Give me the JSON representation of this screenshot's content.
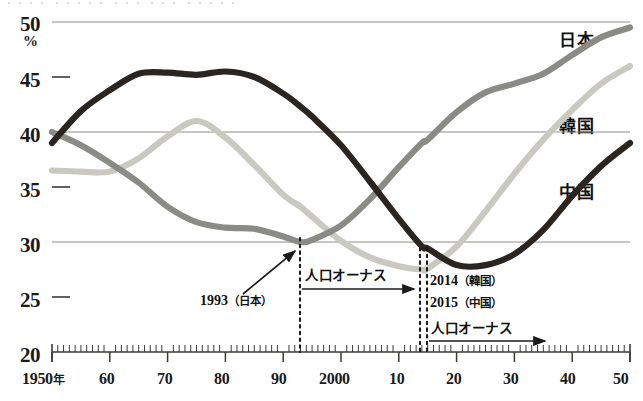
{
  "top_clipped_caption": "・・・・ ・・・・・ ・・・ ・・・ ・・・・・",
  "axes": {
    "y_unit": "%",
    "y_ticks": [
      "20",
      "25",
      "30",
      "35",
      "40",
      "45",
      "50"
    ],
    "x_ticks": [
      "1950年",
      "60",
      "70",
      "80",
      "90",
      "2000",
      "10",
      "20",
      "30",
      "40",
      "50"
    ],
    "x_first_label_main": "1950",
    "x_first_label_suffix": "年"
  },
  "series_labels": {
    "japan": "日本",
    "korea": "韓国",
    "china": "中国"
  },
  "annotations": {
    "japan_turning_point": "1993",
    "japan_turning_point_paren": "（日本）",
    "onus_left": "人口オーナス",
    "korea_turning_point": "2014",
    "korea_turning_point_paren": "（韓国）",
    "china_turning_point": "2015",
    "china_turning_point_paren": "（中国）",
    "onus_right": "人口オーナス"
  },
  "colors": {
    "japan": "#8a8a86",
    "korea": "#c9c9c2",
    "china": "#2b2521",
    "gridline": "#8d8d86",
    "axis": "#3a3a36",
    "text": "#111111"
  },
  "chart_data": {
    "type": "line",
    "title": "",
    "xlabel": "",
    "ylabel": "%",
    "xlim": [
      1950,
      2050
    ],
    "ylim": [
      20,
      50
    ],
    "grid": "horizontal gridlines at 30, 40, 50; tick marks at 25, 35, 45",
    "legend_position": "right, inline at line ends",
    "x": [
      1950,
      1955,
      1960,
      1965,
      1970,
      1975,
      1980,
      1985,
      1990,
      1993,
      1995,
      2000,
      2005,
      2010,
      2014,
      2015,
      2020,
      2025,
      2030,
      2035,
      2040,
      2045,
      2050
    ],
    "series": [
      {
        "name": "日本",
        "color": "#8a8a86",
        "values": [
          40.0,
          38.8,
          37.2,
          35.4,
          33.2,
          31.8,
          31.3,
          31.2,
          30.5,
          30.0,
          30.2,
          31.5,
          33.9,
          36.8,
          39.0,
          39.3,
          41.8,
          43.6,
          44.4,
          45.3,
          47.0,
          48.6,
          49.5
        ]
      },
      {
        "name": "韓国",
        "color": "#c9c9c2",
        "values": [
          36.5,
          36.4,
          36.4,
          37.6,
          39.6,
          41.0,
          39.5,
          37.0,
          34.3,
          33.2,
          32.3,
          30.1,
          28.6,
          27.8,
          27.5,
          27.6,
          29.6,
          32.8,
          36.2,
          39.3,
          42.0,
          44.4,
          46.0
        ]
      },
      {
        "name": "中国",
        "color": "#2b2521",
        "values": [
          39.0,
          41.9,
          43.8,
          45.3,
          45.4,
          45.2,
          45.5,
          45.0,
          43.5,
          42.3,
          41.4,
          38.8,
          35.5,
          32.1,
          29.6,
          29.4,
          27.9,
          27.9,
          28.9,
          31.1,
          34.2,
          36.9,
          39.0
        ]
      }
    ],
    "markers": [
      {
        "label": "1993（日本）",
        "x": 1993,
        "note": "Japan trough / start of population onus"
      },
      {
        "label": "2014（韓国）",
        "x": 2014,
        "note": "Korea start of population onus"
      },
      {
        "label": "2015（中国）",
        "x": 2015,
        "note": "China start of population onus"
      }
    ]
  }
}
